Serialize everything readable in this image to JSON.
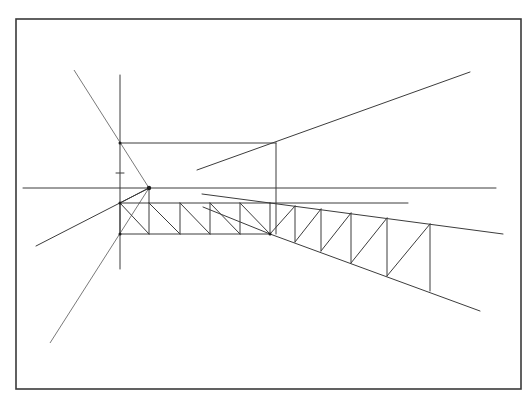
{
  "figure": {
    "canvas": {
      "width": 532,
      "height": 399
    },
    "colors": {
      "background": "#ffffff",
      "ink": "#3c3c3c",
      "frame": "#3a3a3a"
    },
    "frame": {
      "x1": 16,
      "y1": 19,
      "x2": 521,
      "y2": 389
    },
    "horizon_line": {
      "x1": 23,
      "y1": 188,
      "x2": 496,
      "y2": 188
    },
    "vanishing_point": {
      "x": 149,
      "y": 188
    },
    "construction_lines": [
      {
        "name": "picture-plane-vertical",
        "x1": 120,
        "y1": 75,
        "x2": 120,
        "y2": 269
      },
      {
        "name": "diagonal-upper-left",
        "x1": 74,
        "y1": 70,
        "x2": 149,
        "y2": 188
      },
      {
        "name": "diagonal-lower-left",
        "x1": 149,
        "y1": 188,
        "x2": 50,
        "y2": 343
      },
      {
        "name": "ray-to-left",
        "x1": 149,
        "y1": 188,
        "x2": 36,
        "y2": 246
      },
      {
        "name": "ray-upper-right",
        "x1": 197,
        "y1": 170,
        "x2": 470,
        "y2": 72
      },
      {
        "name": "rect-top-edge",
        "x1": 120,
        "y1": 143,
        "x2": 276,
        "y2": 143
      },
      {
        "name": "rect-right-edge",
        "x1": 276,
        "y1": 143,
        "x2": 276,
        "y2": 234
      },
      {
        "name": "second-horizontal",
        "x1": 270,
        "y1": 203,
        "x2": 408,
        "y2": 203
      },
      {
        "name": "converging-upper",
        "x1": 202,
        "y1": 194,
        "x2": 270,
        "y2": 203
      },
      {
        "name": "converging-lower",
        "x1": 203,
        "y1": 207,
        "x2": 270,
        "y2": 234
      },
      {
        "name": "tick-mark",
        "x1": 116,
        "y1": 173,
        "x2": 124,
        "y2": 173
      }
    ],
    "truss_front": {
      "top_y": 203,
      "bottom_y": 234,
      "x_start": 120,
      "x_end": 270,
      "verticals_x": [
        120,
        149,
        180,
        210,
        240,
        270
      ],
      "diagonals": [
        {
          "x1": 120,
          "y1": 203,
          "x2": 149,
          "y2": 234
        },
        {
          "x1": 149,
          "y1": 203,
          "x2": 180,
          "y2": 234
        },
        {
          "x1": 180,
          "y1": 203,
          "x2": 210,
          "y2": 234
        },
        {
          "x1": 210,
          "y1": 203,
          "x2": 240,
          "y2": 234
        },
        {
          "x1": 240,
          "y1": 203,
          "x2": 270,
          "y2": 234
        }
      ],
      "rays_from_vp": [
        {
          "x1": 149,
          "y1": 188,
          "x2": 120,
          "y2": 203
        },
        {
          "x1": 149,
          "y1": 188,
          "x2": 149,
          "y2": 203
        }
      ]
    },
    "truss_receding": {
      "top_chord": {
        "x1": 270,
        "y1": 203,
        "x2": 503,
        "y2": 234
      },
      "bottom_chord": {
        "x1": 270,
        "y1": 234,
        "x2": 480,
        "y2": 311
      },
      "verticals": [
        {
          "x": 295,
          "top": 206,
          "bottom": 242
        },
        {
          "x": 321,
          "top": 209,
          "bottom": 251
        },
        {
          "x": 351,
          "top": 213,
          "bottom": 263
        },
        {
          "x": 387,
          "top": 218,
          "bottom": 276
        },
        {
          "x": 430,
          "top": 224,
          "bottom": 291
        }
      ],
      "diagonals": [
        {
          "x1": 270,
          "y1": 234,
          "x2": 295,
          "y2": 206
        },
        {
          "x1": 295,
          "y1": 242,
          "x2": 321,
          "y2": 209
        },
        {
          "x1": 321,
          "y1": 251,
          "x2": 351,
          "y2": 213
        },
        {
          "x1": 351,
          "y1": 263,
          "x2": 387,
          "y2": 218
        },
        {
          "x1": 387,
          "y1": 276,
          "x2": 430,
          "y2": 224
        }
      ]
    },
    "points": [
      {
        "name": "vp",
        "x": 149,
        "y": 188
      },
      {
        "name": "rect-corner",
        "x": 120,
        "y": 143
      },
      {
        "name": "truss-top-left",
        "x": 120,
        "y": 203
      },
      {
        "name": "truss-bottom-left",
        "x": 120,
        "y": 234
      },
      {
        "name": "truss-junction",
        "x": 270,
        "y": 234
      }
    ]
  }
}
